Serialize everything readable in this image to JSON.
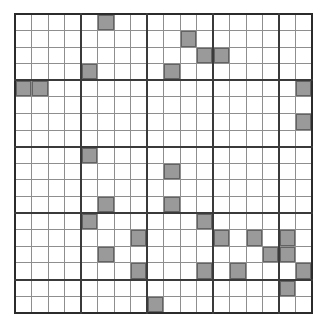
{
  "figure": {
    "kind": "grid-pattern",
    "title": "",
    "rows": 18,
    "cols": 18,
    "block_size": 4,
    "colors": {
      "filled": "#9a9a9a",
      "empty": "#ffffff",
      "thin_line": "#8e8e8e",
      "thick_line": "#3a3a3a",
      "outer_border": "#2b2b2b"
    },
    "legend": {
      "filled_label": "",
      "empty_label": ""
    }
  },
  "chart_data": {
    "type": "heatmap",
    "title": "",
    "xlabel": "",
    "ylabel": "",
    "categories": [
      "0",
      "1",
      "2",
      "3",
      "4",
      "5",
      "6",
      "7",
      "8",
      "9",
      "10",
      "11",
      "12",
      "13",
      "14",
      "15",
      "16",
      "17"
    ],
    "row_labels": [
      "0",
      "1",
      "2",
      "3",
      "4",
      "5",
      "6",
      "7",
      "8",
      "9",
      "10",
      "11",
      "12",
      "13",
      "14",
      "15",
      "16",
      "17"
    ],
    "legend_entries": [],
    "grid": "on",
    "values": [
      [
        0,
        0,
        0,
        0,
        0,
        1,
        0,
        0,
        0,
        0,
        0,
        0,
        0,
        0,
        0,
        0,
        0,
        0
      ],
      [
        0,
        0,
        0,
        0,
        0,
        0,
        0,
        0,
        0,
        0,
        1,
        0,
        0,
        0,
        0,
        0,
        0,
        0
      ],
      [
        0,
        0,
        0,
        0,
        0,
        0,
        0,
        0,
        0,
        0,
        0,
        1,
        1,
        0,
        0,
        0,
        0,
        0
      ],
      [
        0,
        0,
        0,
        0,
        1,
        0,
        0,
        0,
        0,
        1,
        0,
        0,
        0,
        0,
        0,
        0,
        0,
        0
      ],
      [
        1,
        1,
        0,
        0,
        0,
        0,
        0,
        0,
        0,
        0,
        0,
        0,
        0,
        0,
        0,
        0,
        0,
        1
      ],
      [
        0,
        0,
        0,
        0,
        0,
        0,
        0,
        0,
        0,
        0,
        0,
        0,
        0,
        0,
        0,
        0,
        0,
        0
      ],
      [
        0,
        0,
        0,
        0,
        0,
        0,
        0,
        0,
        0,
        0,
        0,
        0,
        0,
        0,
        0,
        0,
        0,
        1
      ],
      [
        0,
        0,
        0,
        0,
        0,
        0,
        0,
        0,
        0,
        0,
        0,
        0,
        0,
        0,
        0,
        0,
        0,
        0
      ],
      [
        0,
        0,
        0,
        0,
        1,
        0,
        0,
        0,
        0,
        0,
        0,
        0,
        0,
        0,
        0,
        0,
        0,
        0
      ],
      [
        0,
        0,
        0,
        0,
        0,
        0,
        0,
        0,
        0,
        1,
        0,
        0,
        0,
        0,
        0,
        0,
        0,
        0
      ],
      [
        0,
        0,
        0,
        0,
        0,
        0,
        0,
        0,
        0,
        0,
        0,
        0,
        0,
        0,
        0,
        0,
        0,
        0
      ],
      [
        0,
        0,
        0,
        0,
        0,
        1,
        0,
        0,
        0,
        1,
        0,
        0,
        0,
        0,
        0,
        0,
        0,
        0
      ],
      [
        0,
        0,
        0,
        0,
        1,
        0,
        0,
        0,
        0,
        0,
        0,
        1,
        0,
        0,
        0,
        0,
        0,
        0
      ],
      [
        0,
        0,
        0,
        0,
        0,
        0,
        0,
        1,
        0,
        0,
        0,
        0,
        1,
        0,
        1,
        0,
        1,
        0
      ],
      [
        0,
        0,
        0,
        0,
        0,
        1,
        0,
        0,
        0,
        0,
        0,
        0,
        0,
        0,
        0,
        1,
        1,
        0
      ],
      [
        0,
        0,
        0,
        0,
        0,
        0,
        0,
        1,
        0,
        0,
        0,
        1,
        0,
        1,
        0,
        0,
        0,
        1
      ],
      [
        0,
        0,
        0,
        0,
        0,
        0,
        0,
        0,
        0,
        0,
        0,
        0,
        0,
        0,
        0,
        0,
        1,
        0
      ],
      [
        0,
        0,
        0,
        0,
        0,
        0,
        0,
        0,
        1,
        0,
        0,
        0,
        0,
        0,
        0,
        0,
        0,
        0
      ]
    ],
    "values_extra": [
      [],
      [],
      [],
      [],
      [],
      [],
      [],
      [],
      [],
      [],
      [],
      [],
      [],
      [],
      [],
      [],
      [],
      []
    ],
    "filled_cells": [
      [
        0,
        5
      ],
      [
        1,
        10
      ],
      [
        2,
        11
      ],
      [
        2,
        12
      ],
      [
        3,
        4
      ],
      [
        3,
        9
      ],
      [
        4,
        0
      ],
      [
        4,
        1
      ],
      [
        4,
        17
      ],
      [
        6,
        17
      ],
      [
        8,
        4
      ],
      [
        9,
        9
      ],
      [
        11,
        5
      ],
      [
        11,
        9
      ],
      [
        12,
        4
      ],
      [
        12,
        11
      ],
      [
        13,
        7
      ],
      [
        13,
        12
      ],
      [
        13,
        14
      ],
      [
        13,
        16
      ],
      [
        14,
        5
      ],
      [
        14,
        15
      ],
      [
        14,
        16
      ],
      [
        15,
        7
      ],
      [
        15,
        11
      ],
      [
        15,
        13
      ],
      [
        15,
        17
      ],
      [
        16,
        0
      ],
      [
        16,
        3
      ],
      [
        16,
        5
      ],
      [
        16,
        8
      ],
      [
        16,
        11
      ],
      [
        16,
        16
      ],
      [
        16,
        17
      ],
      [
        17,
        0
      ],
      [
        17,
        3
      ],
      [
        17,
        4
      ],
      [
        17,
        8
      ],
      [
        17,
        10
      ],
      [
        17,
        13
      ]
    ],
    "zlim": [
      0,
      1
    ]
  }
}
